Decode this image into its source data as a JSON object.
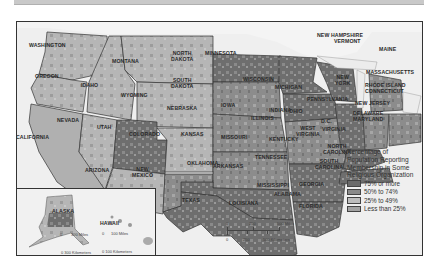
{
  "map": {
    "legend": {
      "title": "Percentage of Population Reporting Membership in Some Religious Organization",
      "title_lines": [
        "Percentage of",
        "Population Reporting",
        "Membership in Some",
        "Religious Organization"
      ],
      "items": [
        {
          "label": "75% or more",
          "color": "#6a6a6a"
        },
        {
          "label": "50% to 74%",
          "color": "#8a8a8a"
        },
        {
          "label": "25% to 49%",
          "color": "#bdbdbd"
        },
        {
          "label": "Less than 25%",
          "color": "#a3a3a3"
        }
      ]
    },
    "states": [
      "WASHINGTON",
      "OREGON",
      "CALIFORNIA",
      "IDAHO",
      "NEVADA",
      "MONTANA",
      "WYOMING",
      "UTAH",
      "COLORADO",
      "ARIZONA",
      "NEW MEXICO",
      "NORTH DAKOTA",
      "SOUTH DAKOTA",
      "NEBRASKA",
      "KANSAS",
      "OKLAHOMA",
      "TEXAS",
      "MINNESOTA",
      "IOWA",
      "MISSOURI",
      "ARKANSAS",
      "LOUISIANA",
      "WISCONSIN",
      "ILLINOIS",
      "MICHIGAN",
      "INDIANA",
      "OHIO",
      "KENTUCKY",
      "TENNESSEE",
      "MISSISSIPPI",
      "ALABAMA",
      "GEORGIA",
      "FLORIDA",
      "SOUTH CAROLINA",
      "NORTH CAROLINA",
      "VIRGINIA",
      "WEST VIRGINIA",
      "PENNSYLVANIA",
      "NEW YORK",
      "D.C.",
      "MAINE",
      "NEW HAMPSHIRE",
      "VERMONT",
      "MASSACHUSETTS",
      "RHODE ISLAND",
      "CONNECTICUT",
      "NEW JERSEY",
      "DELAWARE",
      "MARYLAND",
      "ALASKA",
      "HAWAII"
    ],
    "labels": {
      "wa": "WASHINGTON",
      "or": "OREGON",
      "ca": "CALIFORNIA",
      "id": "IDAHO",
      "nv": "NEVADA",
      "mt": "MONTANA",
      "wy": "WYOMING",
      "ut": "UTAH",
      "co": "COLORADO",
      "az": "ARIZONA",
      "nm1": "NEW",
      "nm2": "MEXICO",
      "nd1": "NORTH",
      "nd2": "DAKOTA",
      "sd1": "SOUTH",
      "sd2": "DAKOTA",
      "ne": "NEBRASKA",
      "ks": "KANSAS",
      "ok": "OKLAHOMA",
      "tx": "TEXAS",
      "mn": "MINNESOTA",
      "ia": "IOWA",
      "mo": "MISSOURI",
      "ar": "ARKANSAS",
      "la": "LOUISIANA",
      "wi": "WISCONSIN",
      "il": "ILLINOIS",
      "mi": "MICHIGAN",
      "in": "INDIANA",
      "oh": "OHIO",
      "ky": "KENTUCKY",
      "tn": "TENNESSEE",
      "ms": "MISSISSIPPI",
      "al": "ALABAMA",
      "ga": "GEORGIA",
      "fl": "FLORIDA",
      "sc1": "SOUTH",
      "sc2": "CAROLINA",
      "nc1": "NORTH",
      "nc2": "CAROLINA",
      "va": "VIRGINIA",
      "wv1": "WEST",
      "wv2": "VIRGINIA",
      "pa": "PENNSYLVANIA",
      "ny1": "NEW",
      "ny2": "YORK",
      "dc": "D.C.",
      "me": "MAINE",
      "nh": "NEW HAMPSHIRE",
      "vt": "VERMONT",
      "ma": "MASSACHUSETTS",
      "ri": "RHODE ISLAND",
      "ct": "CONNECTICUT",
      "nj": "NEW JERSEY",
      "de": "DELAWARE",
      "md": "MARYLAND",
      "ak": "ALASKA",
      "hi": "HAWAII"
    },
    "scale_main": {
      "miles_ticks": [
        "0",
        "250",
        "500 Miles"
      ],
      "km_ticks": [
        "0",
        "250",
        "500 Kilometers"
      ]
    },
    "scale_alaska": {
      "miles": "300 Miles",
      "km": "0 300 Kilometers",
      "zero": "0"
    },
    "scale_hawaii": {
      "miles": "100 Miles",
      "km": "0 100 Kilometers",
      "zero": "0"
    }
  }
}
